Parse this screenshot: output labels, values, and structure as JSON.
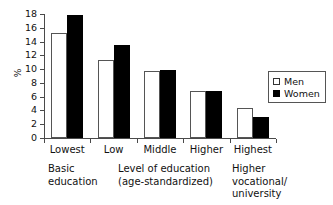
{
  "chart_data": {
    "type": "bar",
    "title": "",
    "xlabel": "Level of education (age-standardized)",
    "ylabel": "%",
    "ylim": [
      0,
      18
    ],
    "ytick_step": 2,
    "yticks": [
      "18",
      "16",
      "14",
      "12",
      "10",
      "8",
      "6",
      "4",
      "2",
      "0"
    ],
    "grid": false,
    "legend_position": "right",
    "categories": [
      "Lowest",
      "Low",
      "Middle",
      "Higher",
      "Highest"
    ],
    "series": [
      {
        "name": "Men",
        "values": [
          15.3,
          11.3,
          9.8,
          6.8,
          4.3
        ]
      },
      {
        "name": "Women",
        "values": [
          17.8,
          13.5,
          9.9,
          6.8,
          3.0
        ]
      }
    ],
    "annotations": [
      "Basic education",
      "Level of education (age-standardized)",
      "Higher vocational/ university"
    ]
  },
  "axis": {
    "y_label": "%",
    "y_ticks": [
      {
        "value": 18,
        "label": "18"
      },
      {
        "value": 16,
        "label": "16"
      },
      {
        "value": 14,
        "label": "14"
      },
      {
        "value": 12,
        "label": "12"
      },
      {
        "value": 10,
        "label": "10"
      },
      {
        "value": 8,
        "label": "8"
      },
      {
        "value": 6,
        "label": "6"
      },
      {
        "value": 4,
        "label": "4"
      },
      {
        "value": 2,
        "label": "2"
      },
      {
        "value": 0,
        "label": "0"
      }
    ],
    "x_categories": [
      {
        "label": "Lowest"
      },
      {
        "label": "Low"
      },
      {
        "label": "Middle"
      },
      {
        "label": "Higher"
      },
      {
        "label": "Highest"
      }
    ]
  },
  "captions": {
    "left_line1": "Basic",
    "left_line2": "education",
    "center_line1": "Level of education",
    "center_line2": "(age-standardized)",
    "right_line1": "Higher",
    "right_line2": "vocational/",
    "right_line3": "university"
  },
  "legend": {
    "items": [
      {
        "label": "Men",
        "color": "#ffffff"
      },
      {
        "label": "Women",
        "color": "#000000"
      }
    ]
  },
  "colors": {
    "men_fill": "#ffffff",
    "women_fill": "#000000",
    "axis": "#4a4a4a",
    "text": "#111111",
    "background": "#ffffff"
  }
}
